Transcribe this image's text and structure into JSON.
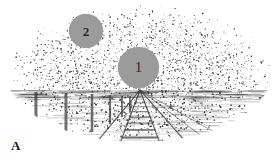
{
  "figure": {
    "panel_label": "A",
    "caption_absent": true
  },
  "markers": [
    {
      "id": "target-1",
      "label": "1",
      "color": "#9b9b9b",
      "text_color": "#2b2b2b",
      "position_note": "near vanishing point, above horizon",
      "cx": 138,
      "cy": 67,
      "diameter": 41
    },
    {
      "id": "target-2",
      "label": "2",
      "color": "#9b9b9b",
      "text_color": "#2b2b2b",
      "position_note": "upper left sky region",
      "cx": 86,
      "cy": 31,
      "diameter": 34
    }
  ],
  "scene": {
    "type": "railway-perspective-stipple",
    "background": "#ffffff",
    "ink_color": "#3d3d3d",
    "vignette": {
      "shape": "ellipse",
      "cx": 139,
      "cy": 72,
      "rx": 133,
      "ry": 70
    },
    "horizon_y": 90,
    "vanishing_point": {
      "x": 140,
      "y": 90
    },
    "rails": [
      {
        "name": "left-outer-rail",
        "bottom_x": 78
      },
      {
        "name": "left-inner-rail",
        "bottom_x": 112
      },
      {
        "name": "right-inner-rail",
        "bottom_x": 168
      },
      {
        "name": "right-outer-rail",
        "bottom_x": 206
      },
      {
        "name": "far-right-siding-a",
        "bottom_x": 240
      },
      {
        "name": "far-right-siding-b",
        "bottom_x": 272
      }
    ],
    "sleeper_count": 16,
    "posts": [
      {
        "name": "post-1",
        "x": 36,
        "top_y": 92,
        "bottom_y": 145
      },
      {
        "name": "post-2",
        "x": 66,
        "top_y": 93,
        "bottom_y": 140
      },
      {
        "name": "post-3",
        "x": 92,
        "top_y": 94,
        "bottom_y": 132
      },
      {
        "name": "post-4",
        "x": 110,
        "top_y": 95,
        "bottom_y": 124
      },
      {
        "name": "post-5",
        "x": 122,
        "top_y": 96,
        "bottom_y": 117
      },
      {
        "name": "post-6",
        "x": 130,
        "top_y": 96,
        "bottom_y": 112
      }
    ]
  }
}
